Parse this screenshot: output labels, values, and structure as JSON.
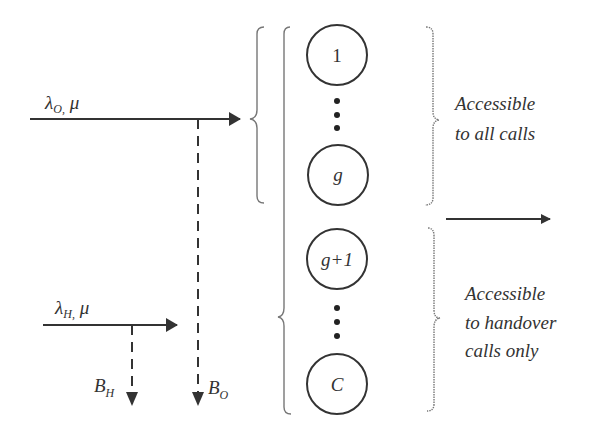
{
  "diagram": {
    "type": "queueing-model",
    "inputs": [
      {
        "id": "originating",
        "rate_symbol": "λ",
        "rate_sub": "O,",
        "service": "μ",
        "blocking_symbol": "B",
        "blocking_sub": "O"
      },
      {
        "id": "handover",
        "rate_symbol": "λ",
        "rate_sub": "H,",
        "service": "μ",
        "blocking_symbol": "B",
        "blocking_sub": "H"
      }
    ],
    "servers": [
      {
        "label": "1",
        "italic": false
      },
      {
        "label": "g",
        "italic": true
      },
      {
        "label": "g+1",
        "italic": true
      },
      {
        "label": "C",
        "italic": true
      }
    ],
    "ellipsis": "⋮",
    "annotations": {
      "upper": [
        "Accessible",
        "to all calls"
      ],
      "lower": [
        "Accessible",
        "to handover",
        "calls only"
      ]
    },
    "colors": {
      "stroke": "#333333",
      "brace": "#777777",
      "background": "#ffffff"
    }
  }
}
